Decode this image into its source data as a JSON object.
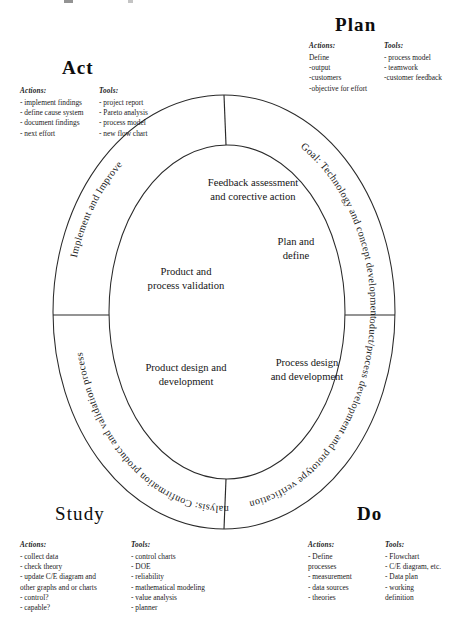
{
  "diagram": {
    "quadrants": [
      {
        "id": "act",
        "title": "Act",
        "actions_header": "Actions:",
        "actions": [
          "- implement findings",
          "- define cause system",
          "- document findings",
          "- next effort"
        ],
        "tools_header": "Tools:",
        "tools": [
          "- project report",
          "- Pareto analysis",
          "- process model",
          "- new flow chart"
        ],
        "ring_label": "Implement and Improve",
        "inner_label_line1": "Feedback assessment",
        "inner_label_line2": "and corective action",
        "inner_label2_line1": "Product and",
        "inner_label2_line2": "process validation"
      },
      {
        "id": "plan",
        "title": "Plan",
        "actions_header": "Actions:",
        "actions": [
          "Define",
          "-output",
          "-customers",
          "-objective for effort"
        ],
        "tools_header": "Tools:",
        "tools": [
          "- process model",
          "- teamwork",
          "-customer feedback"
        ],
        "ring_label": "Goal: Technology and concept development",
        "inner_label_line1": "Plan and",
        "inner_label_line2": "define"
      },
      {
        "id": "study",
        "title": "Study",
        "actions_header": "Actions:",
        "actions": [
          "- collect data",
          "- check theory",
          "- update C/E diagram and",
          "other graphs and or charts",
          "- control?",
          "- capable?"
        ],
        "tools_header": "Tools:",
        "tools": [
          "- control charts",
          "- DOE",
          "- reliability",
          "- mathematical modeling",
          "- value analysis",
          "- planner"
        ],
        "ring_label": "Analysis: Confirmation product and validation process",
        "inner_label_line1": "Product design and",
        "inner_label_line2": "development"
      },
      {
        "id": "do",
        "title": "Do",
        "actions_header": "Actions:",
        "actions": [
          "- Define",
          "processes",
          "- measurement",
          "- data sources",
          "- theories"
        ],
        "tools_header": "Tools:",
        "tools": [
          "- Flowchart",
          "- C/E diagram, etc.",
          "- Data plan",
          "- working",
          "definition"
        ],
        "ring_label": "Planning: Product/process development and prototype verification",
        "inner_label_line1": "Process design",
        "inner_label_line2": "and development"
      }
    ],
    "colors": {
      "stroke": "#2a2a2a",
      "text": "#141414",
      "background": "#ffffff"
    }
  }
}
